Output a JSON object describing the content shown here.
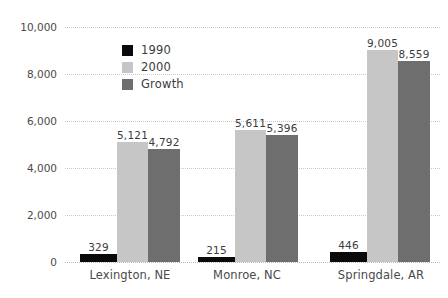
{
  "chart_data": {
    "type": "bar",
    "title": "",
    "subtitle": "",
    "xlabel": "",
    "ylabel": "",
    "categories": [
      "Lexington, NE",
      "Monroe, NC",
      "Springdale, AR"
    ],
    "series": [
      {
        "name": "1990",
        "color": "#0a0a0a",
        "values": [
          329,
          215,
          446
        ]
      },
      {
        "name": "2000",
        "color": "#c6c6c6",
        "values": [
          5121,
          5611,
          9005
        ]
      },
      {
        "name": "Growth",
        "color": "#6e6e6e",
        "values": [
          4792,
          5396,
          8559
        ]
      }
    ],
    "value_labels": [
      [
        "329",
        "5,121",
        "4,792"
      ],
      [
        "215",
        "5,611",
        "5,396"
      ],
      [
        "446",
        "9,005",
        "8,559"
      ]
    ],
    "ylim": [
      0,
      10000
    ],
    "yticks": [
      0,
      2000,
      4000,
      6000,
      8000,
      10000
    ],
    "ytick_labels": [
      "0",
      "2,000",
      "4,000",
      "6,000",
      "8,000",
      "10,000"
    ],
    "grid": true,
    "grid_style": "dotted",
    "grid_color": "#c9c9c9",
    "legend_position": "upper center"
  }
}
